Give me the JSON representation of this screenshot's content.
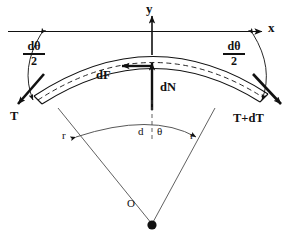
{
  "figure": {
    "background_color": "#ffffff",
    "line_color": "#111111"
  },
  "axes": {
    "y_label": "y",
    "x_label": "x"
  },
  "forces": {
    "friction_label": "dF",
    "normal_label": "dN",
    "tension_left_label": "T",
    "tension_right_label": "T+dT"
  },
  "angles": {
    "half_angle_left_numerator": "dθ",
    "half_angle_left_denominator": "2",
    "half_angle_right_numerator": "dθ",
    "half_angle_right_denominator": "2",
    "center_angle_d": "d",
    "center_angle_theta": "θ"
  },
  "radii": {
    "left_label": "r",
    "right_label": "r"
  },
  "center": {
    "origin_label": "O"
  }
}
